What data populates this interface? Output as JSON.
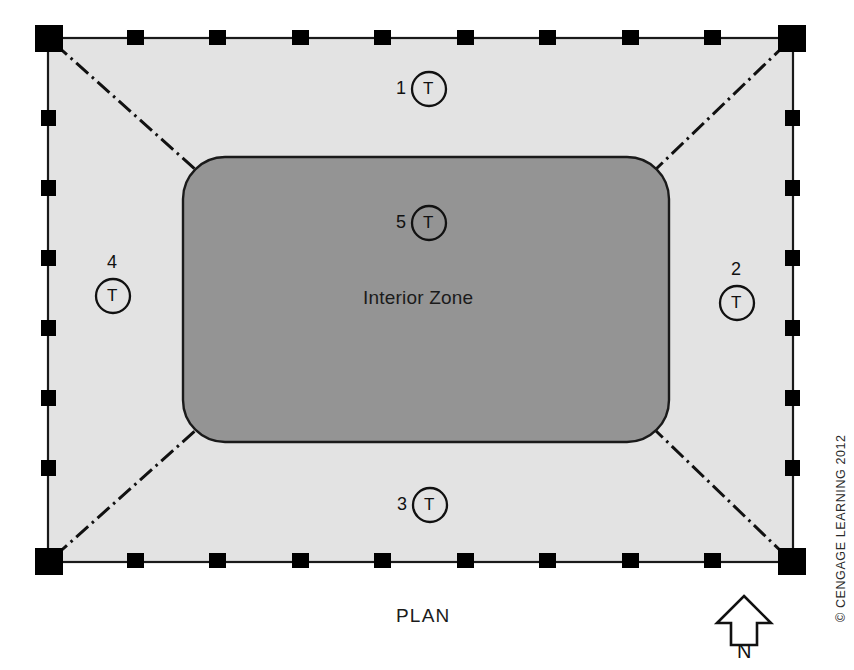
{
  "figure": {
    "type": "architectural-floor-plan",
    "title_label": "PLAN",
    "interior_zone_label": "Interior Zone",
    "credit": "© CENGAGE LEARNING 2012",
    "north_indicator": {
      "letter": "N",
      "direction": "up",
      "icon": "north-arrow-icon"
    }
  },
  "colors": {
    "perimeter_zone_fill": "#e3e3e3",
    "interior_zone_fill": "#949494",
    "outline": "#1a1a1a",
    "column_fill": "#000000",
    "background": "#ffffff",
    "text": "#1a1a1a"
  },
  "building": {
    "outline_shape": "rectangle",
    "corner_columns_count": 4,
    "perimeter_columns_top": 8,
    "perimeter_columns_bottom": 8,
    "perimeter_columns_left": 6,
    "perimeter_columns_right": 6,
    "zone_divider_style": "dash-dot",
    "zone_divider_count": 4
  },
  "thermostats": [
    {
      "id": "1",
      "letter": "T",
      "zone": "north-perimeter",
      "label_position": "left"
    },
    {
      "id": "2",
      "letter": "T",
      "zone": "east-perimeter",
      "label_position": "above"
    },
    {
      "id": "3",
      "letter": "T",
      "zone": "south-perimeter",
      "label_position": "left"
    },
    {
      "id": "4",
      "letter": "T",
      "zone": "west-perimeter",
      "label_position": "above"
    },
    {
      "id": "5",
      "letter": "T",
      "zone": "interior",
      "label_position": "left"
    }
  ],
  "zones": [
    {
      "name": "North Perimeter Zone",
      "thermostat": "1"
    },
    {
      "name": "East Perimeter Zone",
      "thermostat": "2"
    },
    {
      "name": "South Perimeter Zone",
      "thermostat": "3"
    },
    {
      "name": "West Perimeter Zone",
      "thermostat": "4"
    },
    {
      "name": "Interior Zone",
      "thermostat": "5"
    }
  ]
}
